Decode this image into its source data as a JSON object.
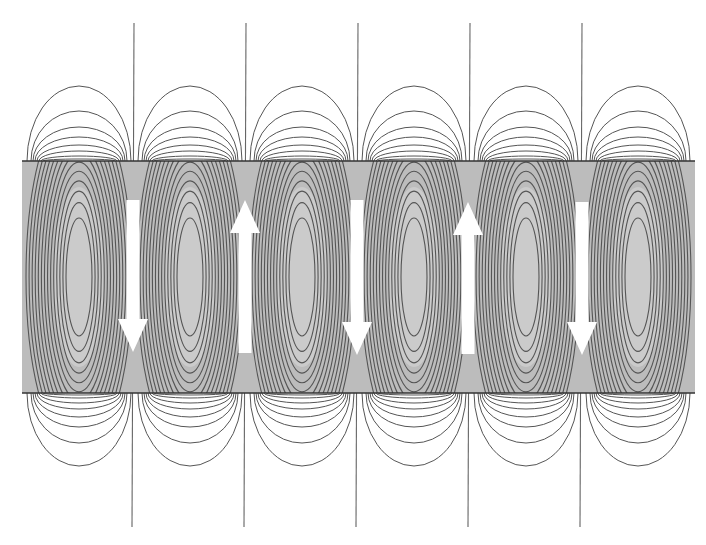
{
  "diagram": {
    "title": "",
    "canvas": {
      "width": 706,
      "height": 545,
      "background": "#ffffff"
    },
    "band": {
      "x": 22,
      "y": 161,
      "width": 673,
      "height": 232,
      "fill": "#bcbcbc",
      "inner_fill": "#cbcbcb",
      "border_color": "#333333"
    },
    "cells": {
      "count": 6,
      "centers_x": [
        79,
        190,
        302,
        414,
        526,
        638
      ],
      "center_y": 277,
      "half_width": 52,
      "inner_loops": 14,
      "outer_loops": 8,
      "line_color": "#555555"
    },
    "boundary_lines": {
      "x": [
        134,
        246,
        358,
        470,
        582
      ],
      "top_y": 23,
      "bottom_y": 527,
      "color": "#666666"
    },
    "arrows": [
      {
        "direction": "down",
        "x": 133,
        "top": 200,
        "bottom": 352
      },
      {
        "direction": "up",
        "x": 245,
        "top": 200,
        "bottom": 353
      },
      {
        "direction": "down",
        "x": 357,
        "top": 200,
        "bottom": 355
      },
      {
        "direction": "up",
        "x": 468,
        "top": 202,
        "bottom": 354
      },
      {
        "direction": "down",
        "x": 582,
        "top": 202,
        "bottom": 355
      }
    ],
    "arrow_style": {
      "color": "#ffffff",
      "shaft_width": 13,
      "head_width": 30,
      "head_length": 33
    }
  }
}
